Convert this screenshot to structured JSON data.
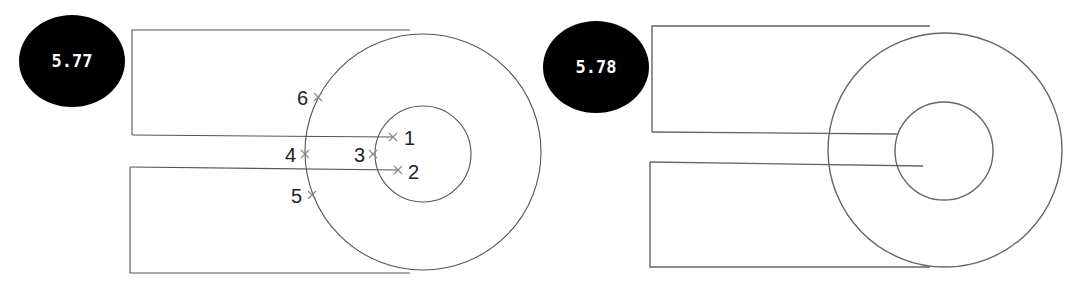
{
  "figures": [
    {
      "id": "left",
      "badge": {
        "label": "5.77",
        "cx": 72,
        "cy": 61,
        "rx": 53,
        "ry": 46,
        "color": "#000000"
      },
      "top_rect": {
        "x1": 132,
        "x2": 410,
        "y_top": 30,
        "y_bot": 135
      },
      "bottom_rect": {
        "x1": 130,
        "x2": 410,
        "y_top": 167,
        "y_bot": 273
      },
      "outer_circle": {
        "cx": 423,
        "cy": 152,
        "r": 118
      },
      "inner_circle": {
        "cx": 423,
        "cy": 154,
        "r": 48
      },
      "lines": [
        {
          "x1": 132,
          "y1": 135,
          "x2": 393,
          "y2": 137
        },
        {
          "x1": 130,
          "y1": 167,
          "x2": 398,
          "y2": 170
        }
      ],
      "points": [
        {
          "label": "1",
          "x": 393,
          "y": 137,
          "lx": 404,
          "ly": 145
        },
        {
          "label": "2",
          "x": 398,
          "y": 170,
          "lx": 408,
          "ly": 179
        },
        {
          "label": "3",
          "x": 373,
          "y": 154,
          "lx": 354,
          "ly": 162
        },
        {
          "label": "4",
          "x": 305,
          "y": 154,
          "lx": 285,
          "ly": 162
        },
        {
          "label": "5",
          "x": 312,
          "y": 195,
          "lx": 291,
          "ly": 203
        },
        {
          "label": "6",
          "x": 318,
          "y": 97,
          "lx": 297,
          "ly": 105
        }
      ]
    },
    {
      "id": "right",
      "badge": {
        "label": "5.78",
        "cx": 596,
        "cy": 67,
        "rx": 53,
        "ry": 46,
        "color": "#000000"
      },
      "top_rect": {
        "x1": 652,
        "x2": 930,
        "y_top": 26,
        "y_bot": 132
      },
      "bottom_rect": {
        "x1": 650,
        "x2": 930,
        "y_top": 162,
        "y_bot": 267
      },
      "outer_circle": {
        "cx": 945,
        "cy": 150,
        "r": 117
      },
      "inner_circle": {
        "cx": 944,
        "cy": 151,
        "r": 49
      },
      "lines": [
        {
          "x1": 652,
          "y1": 132,
          "x2": 897,
          "y2": 134
        },
        {
          "x1": 650,
          "y1": 162,
          "x2": 923,
          "y2": 166
        }
      ],
      "points": []
    }
  ]
}
